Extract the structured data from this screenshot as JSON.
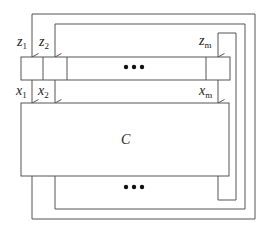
{
  "diagram": {
    "circuit_label": "C",
    "register_cells": [
      {
        "name": "z",
        "sub": "1"
      },
      {
        "name": "z",
        "sub": "2"
      },
      {
        "name": "z",
        "sub": "m"
      }
    ],
    "inputs": [
      {
        "name": "x",
        "sub": "1"
      },
      {
        "name": "x",
        "sub": "2"
      },
      {
        "name": "x",
        "sub": "m"
      }
    ],
    "ellipsis": "•••",
    "line_color": "#555555"
  }
}
